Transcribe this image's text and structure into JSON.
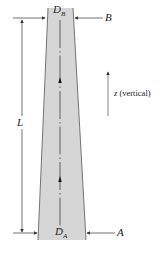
{
  "figure": {
    "labels": {
      "top_diameter": "D",
      "top_diameter_sub": "B",
      "bottom_diameter": "D",
      "bottom_diameter_sub": "A",
      "top_point": "B",
      "bottom_point": "A",
      "length": "L",
      "axis_var": "z",
      "axis_desc": "(vertical)"
    },
    "colors": {
      "column_fill": "#d6d6d6",
      "outline": "#555555",
      "arrow": "#333333"
    }
  }
}
